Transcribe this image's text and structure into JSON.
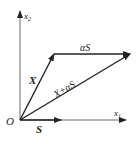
{
  "diagram": {
    "origin_label": "O",
    "axis_x1_label": "x",
    "axis_x1_sub": "1",
    "axis_x2_label": "x",
    "axis_x2_sub": "2",
    "vectors": {
      "X": "X",
      "S": "S",
      "alphaS": "αS",
      "sum": "X+αS"
    },
    "color": "#222222"
  }
}
